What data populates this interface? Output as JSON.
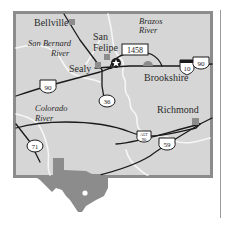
{
  "map": {
    "colors": {
      "frame": "#8c8c8c",
      "land": "#d6d6d6",
      "river": "#f4f4f4",
      "road": "#1a1a1a",
      "town": "#8c8c8c",
      "texas": "#8c8c8c"
    },
    "towns": [
      {
        "name": "Bellville",
        "label": "Bellville"
      },
      {
        "name": "San Felipe",
        "label_line1": "San",
        "label_line2": "Felipe"
      },
      {
        "name": "Sealy",
        "label": "Sealy"
      },
      {
        "name": "Brookshire",
        "label": "Brookshire"
      },
      {
        "name": "Richmond",
        "label": "Richmond"
      }
    ],
    "rivers": [
      {
        "name": "Brazos River",
        "line1": "Brazos",
        "line2": "River"
      },
      {
        "name": "San Bernard River",
        "line1": "San Bernard",
        "line2": "River"
      },
      {
        "name": "Colorado River",
        "line1": "Colorado",
        "line2": "River"
      }
    ],
    "route_shields": [
      {
        "id": "fm-1458",
        "label": "1458",
        "type": "farm-road"
      },
      {
        "id": "us-90-east",
        "label": "90",
        "type": "us-highway"
      },
      {
        "id": "i-10",
        "label": "10",
        "type": "interstate"
      },
      {
        "id": "us-90-west",
        "label": "90",
        "type": "us-highway"
      },
      {
        "id": "sh-36",
        "label": "36",
        "type": "state-highway"
      },
      {
        "id": "alt-90",
        "label_line1": "ALT",
        "label_line2": "90",
        "type": "us-highway"
      },
      {
        "id": "us-59",
        "label": "59",
        "type": "us-highway"
      },
      {
        "id": "sh-71",
        "label": "71",
        "type": "state-highway"
      }
    ],
    "markers": [
      {
        "id": "star",
        "type": "star-marker"
      }
    ],
    "inset": {
      "name": "Texas locator",
      "type": "texas-silhouette"
    }
  }
}
